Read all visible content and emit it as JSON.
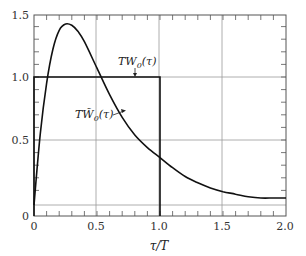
{
  "chart_data": {
    "type": "line",
    "title": "",
    "xlabel": "τ/T",
    "ylabel": "",
    "xlim": [
      0,
      2.0
    ],
    "ylim": [
      0,
      1.5
    ],
    "grid": true,
    "x_ticks": [
      "0",
      "0.5",
      "1.0",
      "1.5",
      "2.0"
    ],
    "y_ticks": [
      "0",
      "0.5",
      "1.0",
      "1.5"
    ],
    "series": [
      {
        "name": "TW0(τ)",
        "label": "TW",
        "label_sub": "0",
        "label_arg": "(τ)",
        "kind": "step",
        "x": [
          0,
          0,
          1.0,
          1.0
        ],
        "values": [
          0,
          1.0,
          1.0,
          0
        ]
      },
      {
        "name": "TW̃0(τ)",
        "label": "TW̃",
        "label_sub": "0",
        "label_arg": "(τ)",
        "kind": "curve",
        "x": [
          0,
          0.05,
          0.1,
          0.15,
          0.2,
          0.25,
          0.3,
          0.35,
          0.4,
          0.5,
          0.6,
          0.7,
          0.8,
          0.9,
          1.0,
          1.1,
          1.2,
          1.3,
          1.4,
          1.5,
          1.6,
          1.7,
          1.8,
          1.9,
          2.0
        ],
        "values": [
          0.0,
          0.55,
          0.95,
          1.22,
          1.37,
          1.42,
          1.41,
          1.36,
          1.28,
          1.07,
          0.86,
          0.68,
          0.54,
          0.44,
          0.36,
          0.28,
          0.21,
          0.16,
          0.12,
          0.09,
          0.07,
          0.05,
          0.04,
          0.04,
          0.04
        ]
      }
    ],
    "annotations": [
      {
        "text": "TW0(τ)",
        "points_to": "step top near τ=0.6"
      },
      {
        "text": "TW̃0(τ)",
        "points_to": "curve near τ=0.8"
      }
    ]
  }
}
